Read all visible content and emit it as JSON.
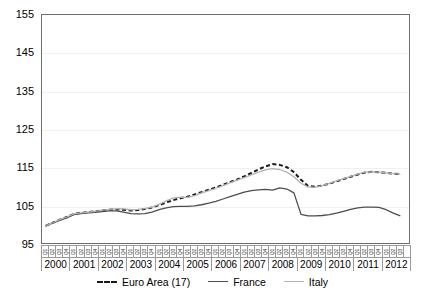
{
  "chart_data": {
    "type": "line",
    "title": "",
    "subtitle": "",
    "xlabel": "",
    "ylabel": "",
    "ylim": [
      95,
      155
    ],
    "yticks": [
      95,
      105,
      115,
      125,
      135,
      145,
      155
    ],
    "grid": true,
    "legend_position": "bottom",
    "x_major_labels": [
      "2000",
      "2001",
      "2002",
      "2003",
      "2004",
      "2005",
      "2006",
      "2007",
      "2008",
      "2009",
      "2010",
      "2011",
      "2012"
    ],
    "x_minor_labels": [
      "Q1",
      "Q2",
      "Q3",
      "Q4"
    ],
    "x": [
      "2000Q1",
      "2000Q2",
      "2000Q3",
      "2000Q4",
      "2001Q1",
      "2001Q2",
      "2001Q3",
      "2001Q4",
      "2002Q1",
      "2002Q2",
      "2002Q3",
      "2002Q4",
      "2003Q1",
      "2003Q2",
      "2003Q3",
      "2003Q4",
      "2004Q1",
      "2004Q2",
      "2004Q3",
      "2004Q4",
      "2005Q1",
      "2005Q2",
      "2005Q3",
      "2005Q4",
      "2006Q1",
      "2006Q2",
      "2006Q3",
      "2006Q4",
      "2007Q1",
      "2007Q2",
      "2007Q3",
      "2007Q4",
      "2008Q1",
      "2008Q2",
      "2008Q3",
      "2008Q4",
      "2009Q1",
      "2009Q2",
      "2009Q3",
      "2009Q4",
      "2010Q1",
      "2010Q2",
      "2010Q3",
      "2010Q4",
      "2011Q1",
      "2011Q2",
      "2011Q3",
      "2011Q4",
      "2012Q1",
      "2012Q2",
      "2012Q3"
    ],
    "series": [
      {
        "name": "Euro Area (17)",
        "color": "#1a1a1a",
        "style": "dashed",
        "values": [
          100.0,
          100.8,
          101.6,
          102.3,
          103.1,
          103.4,
          103.6,
          103.8,
          104.0,
          104.2,
          104.3,
          104.2,
          104.0,
          104.1,
          104.4,
          104.8,
          105.4,
          106.1,
          106.7,
          107.2,
          107.6,
          108.2,
          108.8,
          109.4,
          110.0,
          110.7,
          111.4,
          112.1,
          112.9,
          113.8,
          114.7,
          115.5,
          116.1,
          115.9,
          115.3,
          114.0,
          112.0,
          110.4,
          110.2,
          110.5,
          111.0,
          111.6,
          112.2,
          112.8,
          113.4,
          113.9,
          114.1,
          114.0,
          113.8,
          113.6,
          113.5
        ]
      },
      {
        "name": "France",
        "color": "#4d4d4d",
        "style": "solid",
        "values": [
          100.0,
          100.7,
          101.4,
          102.1,
          102.9,
          103.2,
          103.4,
          103.5,
          103.7,
          103.9,
          103.9,
          103.6,
          103.2,
          103.1,
          103.2,
          103.6,
          104.2,
          104.7,
          105.0,
          105.1,
          105.1,
          105.2,
          105.5,
          105.9,
          106.4,
          107.0,
          107.6,
          108.2,
          108.8,
          109.2,
          109.4,
          109.5,
          109.3,
          109.9,
          109.6,
          108.6,
          103.0,
          102.6,
          102.6,
          102.7,
          102.9,
          103.3,
          103.8,
          104.3,
          104.7,
          104.9,
          104.9,
          104.8,
          104.2,
          103.3,
          102.6
        ]
      },
      {
        "name": "Italy",
        "color": "#b3b3b3",
        "style": "solid",
        "values": [
          100.0,
          100.8,
          101.6,
          102.3,
          103.1,
          103.4,
          103.6,
          103.8,
          104.1,
          104.3,
          104.5,
          104.4,
          104.2,
          104.3,
          104.5,
          104.9,
          105.6,
          106.5,
          107.3,
          107.5,
          107.4,
          107.9,
          108.6,
          109.2,
          109.8,
          110.5,
          111.2,
          111.9,
          112.6,
          113.3,
          114.0,
          114.6,
          114.9,
          114.7,
          114.0,
          112.8,
          111.1,
          110.1,
          110.1,
          110.5,
          111.1,
          111.7,
          112.3,
          112.9,
          113.5,
          114.0,
          114.1,
          114.0,
          113.8,
          113.6,
          113.5
        ]
      }
    ]
  },
  "y_axis": {
    "labels": [
      "155",
      "145",
      "135",
      "125",
      "115",
      "105",
      "95"
    ]
  },
  "x_axis": {
    "years": [
      "2000",
      "2001",
      "2002",
      "2003",
      "2004",
      "2005",
      "2006",
      "2007",
      "2008",
      "2009",
      "2010",
      "2011",
      "2012"
    ],
    "quarters": [
      "Q1",
      "Q2",
      "Q3",
      "Q4"
    ]
  },
  "legend": {
    "items": [
      {
        "label": "Euro Area (17)",
        "color": "#1a1a1a",
        "style": "dashed"
      },
      {
        "label": "France",
        "color": "#4d4d4d",
        "style": "solid"
      },
      {
        "label": "Italy",
        "color": "#b3b3b3",
        "style": "solid"
      }
    ]
  }
}
